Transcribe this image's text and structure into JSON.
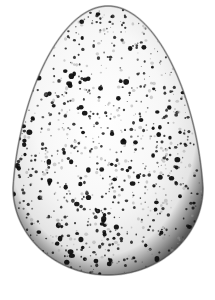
{
  "image": {
    "subject": "speckled egg",
    "background_color": "#ffffff",
    "width": 215,
    "height": 300
  },
  "egg": {
    "top_y": 6,
    "bottom_y": 275,
    "left_x": 13,
    "right_x": 203,
    "widest_y": 188,
    "shell_light": "#ffffff",
    "shell_mid": "#e4e4e4",
    "shell_edge": "#5a5a5a",
    "outline": "#3a3a3a"
  },
  "specks": {
    "seed": 20240611,
    "count": 900,
    "color_dark": "#111111",
    "color_mid": "#4a4a4a",
    "color_light": "#9a9a9a",
    "max_radius": 2.6,
    "min_radius": 0.4
  }
}
